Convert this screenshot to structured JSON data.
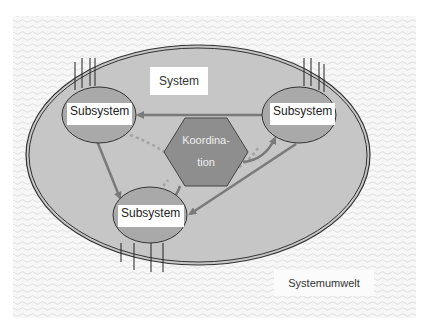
{
  "labels": {
    "system": "System",
    "environment": "Systemumwelt",
    "coordination_line1": "Koordina-",
    "coordination_line2": "tion",
    "subsystem_left": "Subsystem",
    "subsystem_right": "Subsystem",
    "subsystem_bottom": "Subsystem"
  },
  "colors": {
    "environment_pattern": "#f0f0f0",
    "system_fill": "#c4c4c4",
    "system_border": "#3a3a3a",
    "subsystem_fill": "#a8a8a8",
    "hexagon_fill": "#8c8c8c",
    "arrow": "#7a7a7a",
    "dotted_link": "#a0a0a0",
    "label_bg": "#ffffff"
  },
  "nodes": [
    {
      "id": "subsystem_left",
      "label": "Subsystem",
      "type": "ellipse"
    },
    {
      "id": "subsystem_right",
      "label": "Subsystem",
      "type": "ellipse"
    },
    {
      "id": "subsystem_bottom",
      "label": "Subsystem",
      "type": "ellipse"
    },
    {
      "id": "coordination",
      "label": "Koordina-tion",
      "type": "hexagon"
    }
  ],
  "edges": [
    {
      "from": "subsystem_right",
      "to": "subsystem_left",
      "style": "solid-arrow"
    },
    {
      "from": "subsystem_left",
      "to": "subsystem_bottom",
      "style": "solid-arrow"
    },
    {
      "from": "subsystem_right",
      "to": "subsystem_bottom",
      "style": "solid-arrow"
    },
    {
      "from": "coordination",
      "to": "subsystem_right",
      "style": "curved-arrow"
    },
    {
      "from": "coordination",
      "to": "subsystem_bottom",
      "style": "curved-arrow"
    },
    {
      "from": "subsystem_left",
      "to": "coordination",
      "style": "dotted"
    },
    {
      "from": "subsystem_right",
      "to": "coordination",
      "style": "dotted"
    },
    {
      "from": "subsystem_bottom",
      "to": "coordination",
      "style": "dotted"
    }
  ]
}
